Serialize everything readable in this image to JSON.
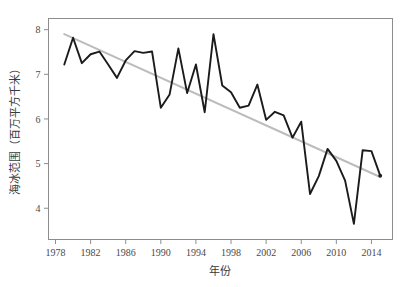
{
  "chart_data": {
    "type": "line",
    "title": "",
    "xlabel": "年份",
    "ylabel": "海冰范围（百万平方千米）",
    "xlim": [
      1977.2,
      2016.4
    ],
    "ylim": [
      3.3,
      8.25
    ],
    "grid": false,
    "legend": "none",
    "xticks": [
      1978,
      1982,
      1986,
      1990,
      1994,
      1998,
      2002,
      2006,
      2010,
      2014
    ],
    "xtick_labels": [
      "1978",
      "1982",
      "1986",
      "1990",
      "1994",
      "1998",
      "2002",
      "2006",
      "2010",
      "2014"
    ],
    "yticks": [
      4,
      5,
      6,
      7,
      8
    ],
    "ytick_labels": [
      "4",
      "5",
      "6",
      "7",
      "8"
    ],
    "x": [
      1979,
      1980,
      1981,
      1982,
      1983,
      1984,
      1985,
      1986,
      1987,
      1988,
      1989,
      1990,
      1991,
      1992,
      1993,
      1994,
      1995,
      1996,
      1997,
      1998,
      1999,
      2000,
      2001,
      2002,
      2003,
      2004,
      2005,
      2006,
      2007,
      2008,
      2009,
      2010,
      2011,
      2012,
      2013,
      2014,
      2015
    ],
    "series": [
      {
        "name": "海冰范围",
        "color": "#1b1b1b",
        "values": [
          7.22,
          7.82,
          7.25,
          7.45,
          7.51,
          7.22,
          6.92,
          7.31,
          7.52,
          7.48,
          7.51,
          6.25,
          6.55,
          7.58,
          6.58,
          7.22,
          6.15,
          7.9,
          6.75,
          6.6,
          6.25,
          6.3,
          6.77,
          5.98,
          6.16,
          6.08,
          5.58,
          5.94,
          4.32,
          4.72,
          5.33,
          5.06,
          4.62,
          3.65,
          5.3,
          5.28,
          4.73
        ]
      },
      {
        "name": "线性趋势",
        "color": "#bcbcbc",
        "type": "trend",
        "x_endpoints": [
          1979,
          2015
        ],
        "y_endpoints": [
          7.9,
          4.7
        ]
      }
    ],
    "annotations": {
      "end_point_marker": true,
      "end_point_x": 2015,
      "end_point_y": 4.73
    }
  },
  "axes": {
    "x_axis_name": "year-axis",
    "y_axis_name": "sea-ice-extent-axis"
  }
}
